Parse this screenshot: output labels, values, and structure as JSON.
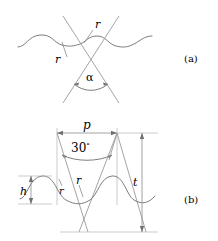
{
  "figure": {
    "kind": "technical-line-drawing",
    "background_color": "#ffffff",
    "line_color": "#8a8a8a",
    "curve_color": "#7d7d7d",
    "text_color": "#2b2b2b",
    "panels": [
      {
        "id": "a",
        "caption": "(a)",
        "description": "wavy surface profile crossed by two straight lines forming an included angle",
        "labels": [
          {
            "name": "radius-upper",
            "text": "r"
          },
          {
            "name": "radius-lower",
            "text": "r"
          },
          {
            "name": "angle-alpha",
            "text": "α"
          }
        ]
      },
      {
        "id": "b",
        "caption": "(b)",
        "description": "thread profile with pitch, flank angle, height and depth dimensions",
        "labels": [
          {
            "name": "pitch",
            "text": "p"
          },
          {
            "name": "flank-angle",
            "text": "30",
            "unit": "°"
          },
          {
            "name": "height",
            "text": "h"
          },
          {
            "name": "radius-left",
            "text": "r"
          },
          {
            "name": "radius-right",
            "text": "r"
          },
          {
            "name": "thickness",
            "text": "t"
          }
        ]
      }
    ]
  },
  "panel_a": {
    "caption": "(a)",
    "r_upper": "r",
    "r_lower": "r",
    "alpha": "α"
  },
  "panel_b": {
    "caption": "(b)",
    "p": "p",
    "angle_value": "30",
    "angle_unit": "°",
    "h": "h",
    "r_left": "r",
    "r_right": "r",
    "t": "t"
  }
}
